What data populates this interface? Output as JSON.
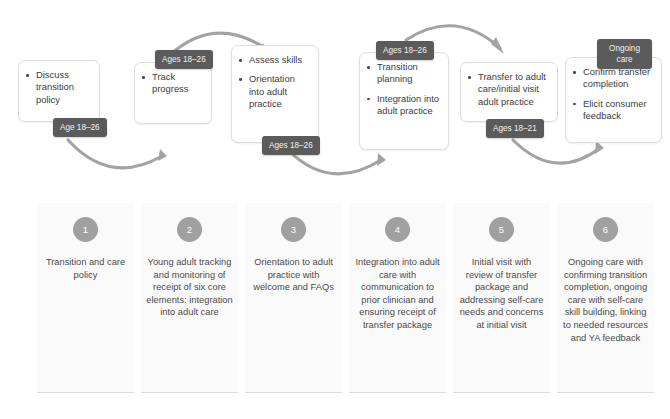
{
  "colors": {
    "tag_bg": "#5b5b5b",
    "tag_text": "#f2f2f2",
    "badge_bg": "#a0a0a0",
    "card_bg": "#fafafa",
    "box_border": "#dedede",
    "arrow": "#9a9a9a",
    "text": "#3c3c3c"
  },
  "flow": {
    "boxes": [
      {
        "id": "discuss-transition-policy",
        "bullets": [
          "Discuss transition policy"
        ]
      },
      {
        "id": "track-progress",
        "bullets": [
          "Track progress"
        ]
      },
      {
        "id": "assess-skills",
        "bullets": [
          "Assess skills",
          "Orientation into adult practice"
        ]
      },
      {
        "id": "transition-planning",
        "bullets": [
          "Transition planning",
          "Integration into adult practice"
        ]
      },
      {
        "id": "transfer-to-adult-care",
        "bullets": [
          "Transfer to adult care/initial visit adult practice"
        ]
      },
      {
        "id": "confirm-transfer-completion",
        "bullets": [
          "Confirm transfer completion",
          "Elicit consumer feedback"
        ]
      }
    ],
    "tags": [
      {
        "id": "tag-age-18-26-a",
        "label": "Age 18–26"
      },
      {
        "id": "tag-ages-18-26-b",
        "label": "Ages 18–26"
      },
      {
        "id": "tag-ages-18-26-c",
        "label": "Ages 18–26"
      },
      {
        "id": "tag-ages-18-26-d",
        "label": "Ages 18–26"
      },
      {
        "id": "tag-ages-18-21-e",
        "label": "Ages 18–21"
      },
      {
        "id": "tag-ongoing-care",
        "label": "Ongoing care"
      }
    ]
  },
  "steps": [
    {
      "number": "1",
      "text": "Transition and care policy"
    },
    {
      "number": "2",
      "text": "Young adult tracking and monitoring of receipt of six core elements: integration into adult care"
    },
    {
      "number": "3",
      "text": "Orientation to adult practice with welcome and FAQs"
    },
    {
      "number": "4",
      "text": "Integration into adult care with communication to prior clinician and ensuring receipt of transfer package"
    },
    {
      "number": "5",
      "text": "Initial visit with review of transfer package and addressing self-care needs and concerns at initial visit"
    },
    {
      "number": "6",
      "text": "Ongoing care with confirming transition completion, ongoing care with self-care skill building, linking to needed resources and YA feedback"
    }
  ]
}
